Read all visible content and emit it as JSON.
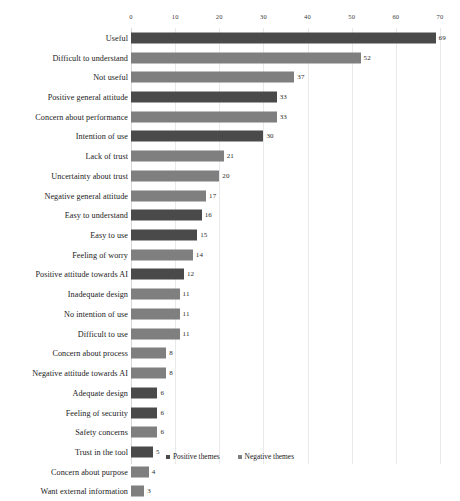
{
  "chart_data": {
    "type": "bar",
    "orientation": "horizontal",
    "title": "",
    "xlabel": "",
    "ylabel": "",
    "xlim": [
      0,
      70
    ],
    "xticks": [
      0,
      10,
      20,
      30,
      40,
      50,
      60,
      70
    ],
    "grid": true,
    "legend_position": "bottom-center",
    "categories": [
      "Useful",
      "Difficult to understand",
      "Not useful",
      "Positive general attitude",
      "Concern about performance",
      "Intention of use",
      "Lack of trust",
      "Uncertainty about trust",
      "Negative general attitude",
      "Easy to understand",
      "Easy to use",
      "Feeling of worry",
      "Positive attitude towards AI",
      "Inadequate design",
      "No intention of use",
      "Difficult to use",
      "Concern about process",
      "Negative attitude towards AI",
      "Adequate design",
      "Feeling of security",
      "Safety concerns",
      "Trust in the tool",
      "Concern about purpose",
      "Want external information"
    ],
    "values": [
      69,
      52,
      37,
      33,
      33,
      30,
      21,
      20,
      17,
      16,
      15,
      14,
      12,
      11,
      11,
      11,
      8,
      8,
      6,
      6,
      6,
      5,
      4,
      3
    ],
    "themes": [
      "positive",
      "negative",
      "negative",
      "positive",
      "negative",
      "positive",
      "negative",
      "negative",
      "negative",
      "positive",
      "positive",
      "negative",
      "positive",
      "negative",
      "negative",
      "negative",
      "negative",
      "negative",
      "positive",
      "positive",
      "negative",
      "positive",
      "negative",
      "negative"
    ],
    "series": [
      {
        "name": "Positive themes",
        "color": "#4a4a4a",
        "points": [
          {
            "category": "Useful",
            "value": 69
          },
          {
            "category": "Positive general attitude",
            "value": 33
          },
          {
            "category": "Intention of use",
            "value": 30
          },
          {
            "category": "Easy to understand",
            "value": 16
          },
          {
            "category": "Easy to use",
            "value": 15
          },
          {
            "category": "Positive attitude towards AI",
            "value": 12
          },
          {
            "category": "Adequate design",
            "value": 6
          },
          {
            "category": "Feeling of security",
            "value": 6
          },
          {
            "category": "Trust in the tool",
            "value": 5
          }
        ]
      },
      {
        "name": "Negative themes",
        "color": "#7f7f7f",
        "points": [
          {
            "category": "Difficult to understand",
            "value": 52
          },
          {
            "category": "Not useful",
            "value": 37
          },
          {
            "category": "Concern about performance",
            "value": 33
          },
          {
            "category": "Lack of trust",
            "value": 21
          },
          {
            "category": "Uncertainty about trust",
            "value": 20
          },
          {
            "category": "Negative general attitude",
            "value": 17
          },
          {
            "category": "Feeling of worry",
            "value": 14
          },
          {
            "category": "Inadequate design",
            "value": 11
          },
          {
            "category": "No intention of use",
            "value": 11
          },
          {
            "category": "Difficult to use",
            "value": 11
          },
          {
            "category": "Concern about process",
            "value": 8
          },
          {
            "category": "Negative attitude towards AI",
            "value": 8
          },
          {
            "category": "Safety concerns",
            "value": 6
          },
          {
            "category": "Concern about purpose",
            "value": 4
          },
          {
            "category": "Want external information",
            "value": 3
          }
        ]
      }
    ],
    "legend": [
      {
        "label": "Positive themes",
        "color": "#4a4a4a"
      },
      {
        "label": "Negative themes",
        "color": "#7f7f7f"
      }
    ]
  }
}
